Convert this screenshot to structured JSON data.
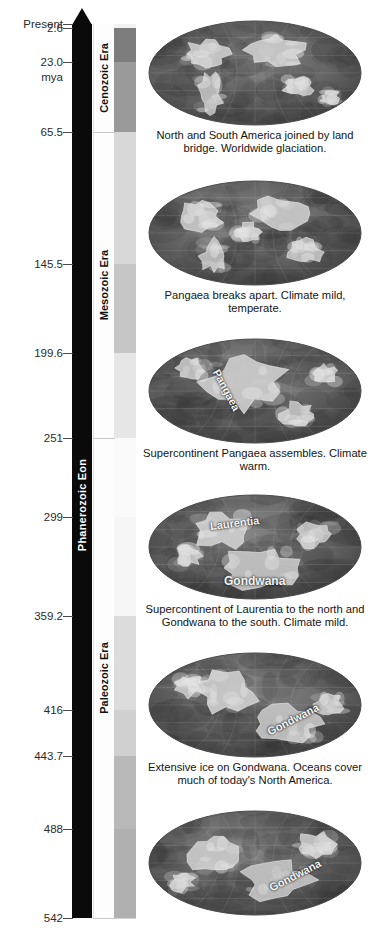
{
  "units_label": "mya",
  "timeline": {
    "present_label": "Present",
    "ticks": [
      {
        "label": "Present",
        "value": 0
      },
      {
        "label": "2.6",
        "value": 2.6
      },
      {
        "label": "23.0",
        "value": 23.0
      },
      {
        "label": "65.5",
        "value": 65.5
      },
      {
        "label": "145.5",
        "value": 145.5
      },
      {
        "label": "199.6",
        "value": 199.6
      },
      {
        "label": "251",
        "value": 251
      },
      {
        "label": "299",
        "value": 299
      },
      {
        "label": "359.2",
        "value": 359.2
      },
      {
        "label": "416",
        "value": 416
      },
      {
        "label": "443.7",
        "value": 443.7
      },
      {
        "label": "488",
        "value": 488
      },
      {
        "label": "542",
        "value": 542
      }
    ],
    "eon": {
      "label": "Phanerozoic Eon",
      "start": 542,
      "end": 0
    },
    "eras": [
      {
        "label": "Cenozoic Era",
        "start": 65.5,
        "end": 0
      },
      {
        "label": "Mesozoic Era",
        "start": 251,
        "end": 65.5
      },
      {
        "label": "Paleozoic Era",
        "start": 542,
        "end": 251
      }
    ],
    "bands": [
      {
        "start": 2.6,
        "end": 0,
        "color": "#f2f2f2"
      },
      {
        "start": 23.0,
        "end": 2.6,
        "color": "#7d7d7d"
      },
      {
        "start": 65.5,
        "end": 23.0,
        "color": "#9a9a9a"
      },
      {
        "start": 145.5,
        "end": 65.5,
        "color": "#d8d8d8"
      },
      {
        "start": 199.6,
        "end": 145.5,
        "color": "#c6c6c6"
      },
      {
        "start": 251,
        "end": 199.6,
        "color": "#e6e6e6"
      },
      {
        "start": 299,
        "end": 251,
        "color": "#fafafa"
      },
      {
        "start": 359.2,
        "end": 299,
        "color": "#f6f6f6"
      },
      {
        "start": 416,
        "end": 359.2,
        "color": "#dcdcdc"
      },
      {
        "start": 443.7,
        "end": 416,
        "color": "#d0d0d0"
      },
      {
        "start": 488,
        "end": 443.7,
        "color": "#b9b9b9"
      },
      {
        "start": 542,
        "end": 488,
        "color": "#b0b0b0"
      }
    ]
  },
  "panels": [
    {
      "id": "panel-cenozoic",
      "caption": "North and South America joined by land bridge. Worldwide glaciation.",
      "map_labels": []
    },
    {
      "id": "panel-cretaceous",
      "caption": "Pangaea breaks apart. Climate mild, temperate.",
      "map_labels": []
    },
    {
      "id": "panel-triassic",
      "caption": "Supercontinent Pangaea assembles. Climate warm.",
      "map_labels": [
        {
          "text": "Pangaea",
          "x": 68,
          "y": 26,
          "rot": 62,
          "size": 11
        }
      ]
    },
    {
      "id": "panel-carboniferous",
      "caption": "Supercontinent of Laurentia to the north and Gondwana to the south. Climate mild.",
      "map_labels": [
        {
          "text": "Laurentia",
          "x": 62,
          "y": 26,
          "rot": -7,
          "size": 11
        },
        {
          "text": "Gondwana",
          "x": 76,
          "y": 80,
          "rot": 0,
          "size": 12
        }
      ]
    },
    {
      "id": "panel-ordovician",
      "caption": "Extensive ice on Gondwana. Oceans cover much of today's North America.",
      "map_labels": [
        {
          "text": "Gondwana",
          "x": 120,
          "y": 74,
          "rot": -27,
          "size": 11
        }
      ]
    },
    {
      "id": "panel-cambrian",
      "caption": "",
      "map_labels": [
        {
          "text": "Gondwana",
          "x": 122,
          "y": 72,
          "rot": -27,
          "size": 11
        }
      ]
    }
  ]
}
